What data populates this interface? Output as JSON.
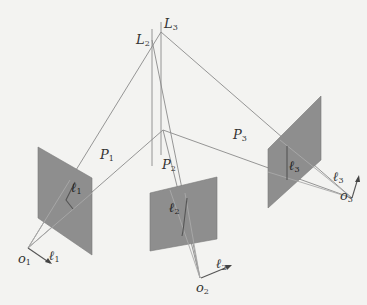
{
  "figure": {
    "labels": {
      "L2": {
        "base": "L",
        "sub": "2"
      },
      "L3": {
        "base": "L",
        "sub": "3"
      },
      "P1": {
        "base": "P",
        "sub": "1"
      },
      "P2": {
        "base": "P",
        "sub": "2"
      },
      "P3": {
        "base": "P",
        "sub": "3"
      },
      "ell1_plane": {
        "base": "ℓ",
        "sub": "1"
      },
      "ell2_plane": {
        "base": "ℓ",
        "sub": "2"
      },
      "ell3_plane": {
        "base": "ℓ",
        "sub": "3"
      },
      "ell1_axis": {
        "base": "ℓ",
        "sub": "1"
      },
      "ell2_axis": {
        "base": "ℓ",
        "sub": "2"
      },
      "ell3_axis": {
        "base": "ℓ",
        "sub": "3"
      },
      "o1": {
        "base": "o",
        "sub": "1"
      },
      "o2": {
        "base": "o",
        "sub": "2"
      },
      "o3": {
        "base": "o",
        "sub": "3"
      }
    },
    "colors": {
      "background": "#f3f3f1",
      "plane_fill": "#8e8e8e",
      "line": "#8a8a8a",
      "dark_line": "#555555",
      "text": "#333333"
    }
  }
}
